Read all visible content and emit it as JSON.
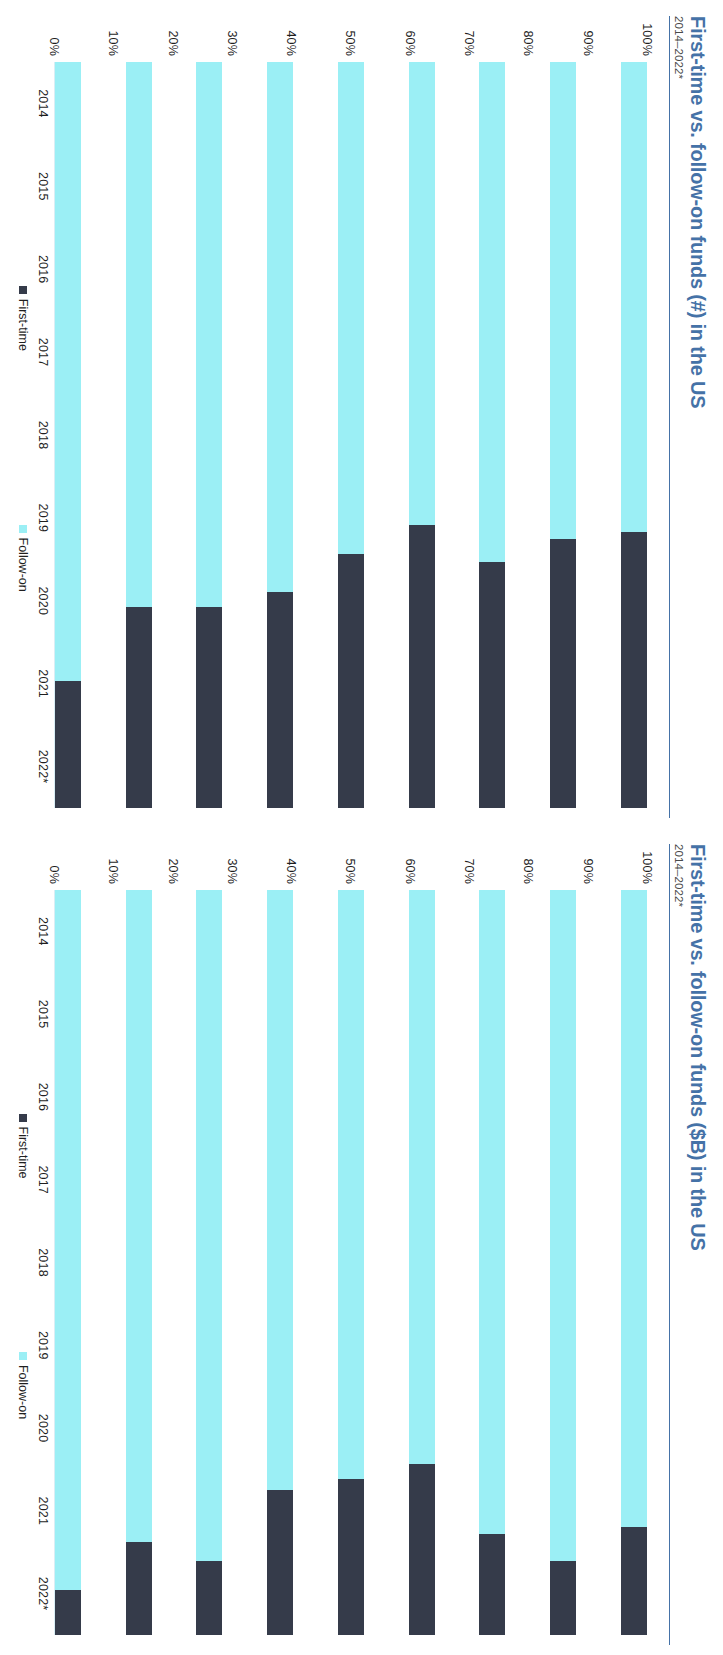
{
  "charts": [
    {
      "id": "funds-count",
      "title": "First-time vs. follow-on funds (#) in the US",
      "subtitle": "2014–2022*",
      "legend": [
        {
          "label": "First-time",
          "color": "#353B4A"
        },
        {
          "label": "Follow-on",
          "color": "#9BEFF5"
        }
      ],
      "yticks": [
        "100%",
        "90%",
        "80%",
        "70%",
        "60%",
        "50%",
        "40%",
        "30%",
        "20%",
        "10%",
        "0%"
      ],
      "chart_data": {
        "type": "bar",
        "stacked": true,
        "orientation": "vertical",
        "title": "First-time vs. follow-on funds (#) in the US",
        "subtitle": "2014–2022*",
        "xlabel": "",
        "ylabel": "",
        "ylim": [
          0,
          100
        ],
        "ytick_labels": [
          "0%",
          "10%",
          "20%",
          "30%",
          "40%",
          "50%",
          "60%",
          "70%",
          "80%",
          "90%",
          "100%"
        ],
        "grid": false,
        "legend_position": "bottom",
        "categories": [
          "2014",
          "2015",
          "2016",
          "2017",
          "2018",
          "2019",
          "2020",
          "2021",
          "2022*"
        ],
        "series": [
          {
            "name": "First-time",
            "color": "#353B4A",
            "values": [
              37,
              36,
              33,
              38,
              34,
              29,
              27,
              27,
              17
            ]
          },
          {
            "name": "Follow-on",
            "color": "#9BEFF5",
            "values": [
              63,
              64,
              67,
              62,
              66,
              71,
              73,
              73,
              83
            ]
          }
        ]
      }
    },
    {
      "id": "funds-dollars",
      "title": "First-time vs. follow-on funds ($B) in the US",
      "subtitle": "2014–2022*",
      "legend": [
        {
          "label": "First-time",
          "color": "#353B4A"
        },
        {
          "label": "Follow-on",
          "color": "#9BEFF5"
        }
      ],
      "yticks": [
        "100%",
        "90%",
        "80%",
        "70%",
        "60%",
        "50%",
        "40%",
        "30%",
        "20%",
        "10%",
        "0%"
      ],
      "chart_data": {
        "type": "bar",
        "stacked": true,
        "orientation": "vertical",
        "title": "First-time vs. follow-on funds ($B) in the US",
        "subtitle": "2014–2022*",
        "xlabel": "",
        "ylabel": "",
        "ylim": [
          0,
          100
        ],
        "ytick_labels": [
          "0%",
          "10%",
          "20%",
          "30%",
          "40%",
          "50%",
          "60%",
          "70%",
          "80%",
          "90%",
          "100%"
        ],
        "grid": false,
        "legend_position": "bottom",
        "categories": [
          "2014",
          "2015",
          "2016",
          "2017",
          "2018",
          "2019",
          "2020",
          "2021",
          "2022*"
        ],
        "series": [
          {
            "name": "First-time",
            "color": "#353B4A",
            "values": [
              14.5,
              10,
              13.5,
              23,
              21,
              19.5,
              10,
              12.5,
              6
            ]
          },
          {
            "name": "Follow-on",
            "color": "#9BEFF5",
            "values": [
              85.5,
              90,
              86.5,
              77,
              79,
              80.5,
              90,
              87.5,
              94
            ]
          }
        ]
      }
    }
  ],
  "colors": {
    "title": "#4572A7",
    "first_time": "#353B4A",
    "follow_on": "#9BEFF5",
    "axis": "#d9eef5"
  }
}
